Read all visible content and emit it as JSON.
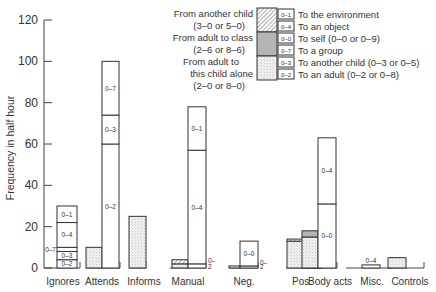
{
  "chart_data": {
    "type": "bar",
    "title": "",
    "xlabel": "",
    "ylabel": "Frequency in half hour",
    "ylim": [
      0,
      120
    ],
    "yticks": [
      0,
      20,
      40,
      60,
      80,
      100,
      120
    ],
    "grid": false,
    "legend_position": "top-right",
    "categories": [
      "Ignores",
      "Attends",
      "Informs",
      "Manual",
      "Neg.",
      "Pos.",
      "Body acts",
      "Misc.",
      "Controls"
    ],
    "legend": {
      "sources": [
        {
          "label": "From another child",
          "sub": "(3–0 or 5–0)",
          "pattern": "hatched"
        },
        {
          "label": "From adult to class",
          "sub": "(2–6 or 8–6)",
          "pattern": "grey"
        },
        {
          "label": "From adult to",
          "sub": "this child alone",
          "sub2": "(2–0 or 8–0)",
          "pattern": "dotted"
        }
      ],
      "targets": [
        {
          "code": "0–1",
          "label": "To the environment"
        },
        {
          "code": "0–4",
          "label": "To an object"
        },
        {
          "code": "0–0",
          "label": "To self (0–0 or 0–9)"
        },
        {
          "code": "0–7",
          "label": "To a group"
        },
        {
          "code": "0–3",
          "label": "To another child (0–3 or 0–5)"
        },
        {
          "code": "0–2",
          "label": "To an adult (0–2 or 0–8)"
        }
      ]
    },
    "bars": [
      {
        "category": "Ignores",
        "stimulus": [],
        "response": [
          {
            "code": "0–2",
            "from": 0,
            "to": 4
          },
          {
            "code": "0–3",
            "from": 4,
            "to": 8
          },
          {
            "code": "0–7",
            "from": 8,
            "to": 10
          },
          {
            "code": "0–4",
            "from": 10,
            "to": 22
          },
          {
            "code": "0–1",
            "from": 22,
            "to": 30
          }
        ]
      },
      {
        "category": "Attends",
        "stimulus": [
          {
            "pattern": "dotted",
            "from": 0,
            "to": 10
          }
        ],
        "response": [
          {
            "code": "0–2",
            "from": 0,
            "to": 60
          },
          {
            "code": "0–3",
            "from": 60,
            "to": 74
          },
          {
            "code": "0–7",
            "from": 74,
            "to": 100
          }
        ]
      },
      {
        "category": "Informs",
        "stimulus": [
          {
            "pattern": "dotted",
            "from": 0,
            "to": 25
          }
        ],
        "response": []
      },
      {
        "category": "Manual",
        "stimulus": [
          {
            "pattern": "dotted",
            "from": 0,
            "to": 2
          },
          {
            "pattern": "hatched",
            "from": 2,
            "to": 4
          }
        ],
        "response": [
          {
            "code": "0–2",
            "from": 0,
            "to": 2
          },
          {
            "code": "0–4",
            "from": 2,
            "to": 57
          },
          {
            "code": "0–1",
            "from": 57,
            "to": 78
          }
        ]
      },
      {
        "category": "Neg.",
        "stimulus": [
          {
            "pattern": "hatched",
            "from": 0,
            "to": 1
          }
        ],
        "response": [
          {
            "code": "0–2",
            "from": 0,
            "to": 1
          },
          {
            "code": "0–0",
            "from": 1,
            "to": 13
          }
        ]
      },
      {
        "category": "Pos.",
        "stimulus": [
          {
            "pattern": "dotted",
            "from": 0,
            "to": 13
          },
          {
            "pattern": "hatched",
            "from": 13,
            "to": 14
          }
        ],
        "response": [
          {
            "code": "0–2",
            "from": 0,
            "to": 5
          },
          {
            "code": "0–4",
            "from": 5,
            "to": 12
          }
        ]
      },
      {
        "category": "Body acts",
        "stimulus": [
          {
            "pattern": "dotted",
            "from": 0,
            "to": 15
          },
          {
            "pattern": "grey",
            "from": 15,
            "to": 18
          }
        ],
        "response": [
          {
            "code": "0–0",
            "from": 0,
            "to": 31
          },
          {
            "code": "0–4",
            "from": 31,
            "to": 63
          }
        ]
      },
      {
        "category": "Misc.",
        "stimulus": [],
        "response": [
          {
            "code": "0–4",
            "from": 0,
            "to": 1.5
          }
        ]
      },
      {
        "category": "Controls",
        "stimulus": [
          {
            "pattern": "dotted",
            "from": 0,
            "to": 5
          }
        ],
        "response": []
      }
    ]
  }
}
